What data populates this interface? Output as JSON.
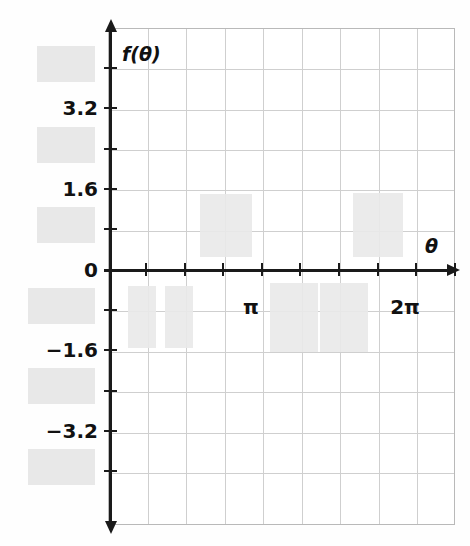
{
  "figure": {
    "kind": "cartesian-graph",
    "x_axis_title": "θ",
    "y_axis_title": "f(θ)",
    "background_color": "#ffffff",
    "grid_color": "#cfcfcf",
    "axis_color": "#1a1a1a",
    "redaction_color": "#e6e6e6"
  },
  "chart_data": {
    "type": "line",
    "title": "",
    "subtitle": "",
    "xlabel": "θ",
    "ylabel": "f(θ)",
    "grid": true,
    "legend": "none",
    "annotations": [],
    "x_axis": {
      "min": -0.39,
      "max": 7.46,
      "tick_step_label": "π/4",
      "visible_tick_labels": [
        "π",
        "2π"
      ],
      "tick_positions_px": [
        146,
        185,
        223,
        262,
        300,
        339,
        378,
        416,
        455
      ],
      "redacted_tick_labels_count": 0
    },
    "y_axis": {
      "min": -4.8,
      "max": 4.8,
      "tick_step": 0.8,
      "visible_tick_labels": [
        "3.2",
        "1.6",
        "0",
        "−1.6",
        "−3.2"
      ],
      "hidden_tick_labels_count": 6
    },
    "series": [],
    "note": "Data curve and several tick labels are obscured by gray redaction rectangles."
  },
  "y_ticks": [
    {
      "value": 4.0,
      "label": "",
      "y_px": 68,
      "redacted": true
    },
    {
      "value": 3.2,
      "label": "3.2",
      "y_px": 108,
      "redacted": false
    },
    {
      "value": 2.4,
      "label": "",
      "y_px": 149,
      "redacted": true
    },
    {
      "value": 1.6,
      "label": "1.6",
      "y_px": 189,
      "redacted": false
    },
    {
      "value": 0.8,
      "label": "",
      "y_px": 229,
      "redacted": true
    },
    {
      "value": 0.0,
      "label": "0",
      "y_px": 270,
      "redacted": false
    },
    {
      "value": -0.8,
      "label": "",
      "y_px": 310,
      "redacted": true
    },
    {
      "value": -1.6,
      "label": "−1.6",
      "y_px": 350,
      "redacted": false
    },
    {
      "value": -2.4,
      "label": "",
      "y_px": 391,
      "redacted": true
    },
    {
      "value": -3.2,
      "label": "−3.2",
      "y_px": 431,
      "redacted": false
    },
    {
      "value": -4.0,
      "label": "",
      "y_px": 471,
      "redacted": true
    }
  ],
  "x_ticks": [
    {
      "value": 0.785,
      "label": "",
      "x_px": 146,
      "redacted": false
    },
    {
      "value": 1.571,
      "label": "",
      "x_px": 185,
      "redacted": false
    },
    {
      "value": 2.356,
      "label": "",
      "x_px": 223,
      "redacted": false
    },
    {
      "value": 3.142,
      "label": "π",
      "x_px": 262,
      "redacted": false
    },
    {
      "value": 3.927,
      "label": "",
      "x_px": 300,
      "redacted": false
    },
    {
      "value": 4.712,
      "label": "",
      "x_px": 339,
      "redacted": false
    },
    {
      "value": 5.498,
      "label": "",
      "x_px": 378,
      "redacted": false
    },
    {
      "value": 6.283,
      "label": "2π",
      "x_px": 416,
      "redacted": false
    },
    {
      "value": 7.069,
      "label": "",
      "x_px": 455,
      "redacted": false
    }
  ],
  "gutter_redactions": [
    {
      "x": 37,
      "y": 46,
      "w": 58,
      "h": 36
    },
    {
      "x": 37,
      "y": 127,
      "w": 58,
      "h": 36
    },
    {
      "x": 37,
      "y": 207,
      "w": 58,
      "h": 36
    },
    {
      "x": 28,
      "y": 288,
      "w": 67,
      "h": 36
    },
    {
      "x": 28,
      "y": 368,
      "w": 67,
      "h": 36
    },
    {
      "x": 28,
      "y": 449,
      "w": 67,
      "h": 36
    }
  ],
  "plot_redactions": [
    {
      "x": 200,
      "y": 194,
      "w": 52,
      "h": 63
    },
    {
      "x": 353,
      "y": 193,
      "w": 50,
      "h": 64
    },
    {
      "x": 128,
      "y": 286,
      "w": 28,
      "h": 62
    },
    {
      "x": 165,
      "y": 286,
      "w": 28,
      "h": 62
    },
    {
      "x": 270,
      "y": 283,
      "w": 48,
      "h": 69
    },
    {
      "x": 320,
      "y": 283,
      "w": 48,
      "h": 69
    }
  ],
  "grid_geometry": {
    "left_px": 108,
    "top_px": 28,
    "width_px": 347,
    "height_px": 497,
    "columns": 9,
    "rows": 12,
    "col_step_px": 38.55,
    "row_step_px": 40.35
  }
}
